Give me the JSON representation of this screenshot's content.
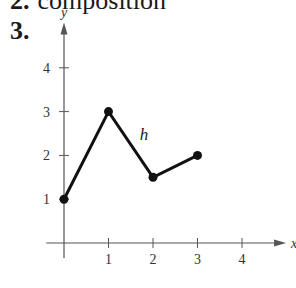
{
  "header": {
    "previous_item_number": "2.",
    "previous_item_text": "composition",
    "current_item_number": "3."
  },
  "chart_data": {
    "type": "line",
    "title": "",
    "xlabel": "x",
    "ylabel": "y",
    "series": [
      {
        "name": "h",
        "points": [
          [
            0,
            1
          ],
          [
            1,
            3
          ],
          [
            2,
            1.5
          ],
          [
            3,
            2
          ]
        ],
        "markers": "filled-circle"
      }
    ],
    "x_ticks": [
      1,
      2,
      3,
      4
    ],
    "y_ticks": [
      1,
      2,
      3,
      4
    ],
    "xlim": [
      -0.4,
      4.9
    ],
    "ylim": [
      -0.35,
      4.9
    ],
    "grid": false,
    "annotations": [
      {
        "text": "h",
        "x": 1.7,
        "y": 2.5
      }
    ]
  },
  "colors": {
    "axis": "#555555",
    "curve": "#111111",
    "text": "#1a1a1a"
  }
}
